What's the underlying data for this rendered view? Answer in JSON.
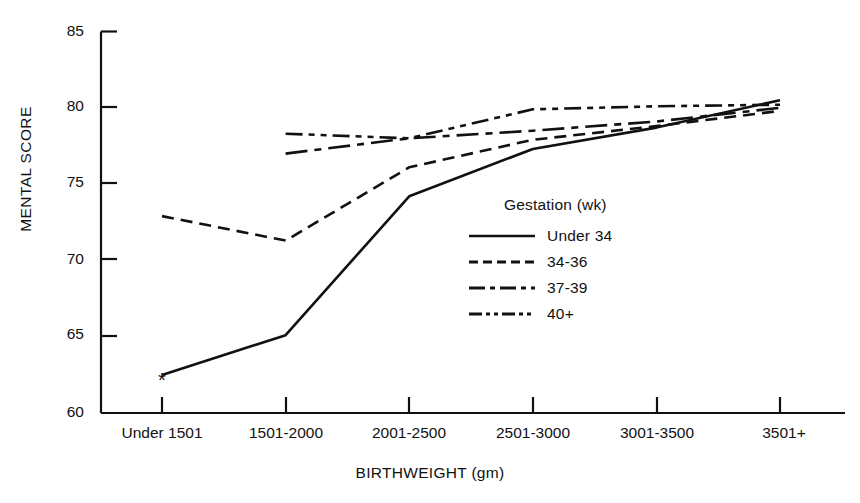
{
  "chart_data": {
    "type": "line",
    "title": "",
    "xlabel": "BIRTHWEIGHT (gm)",
    "ylabel": "MENTAL SCORE",
    "categories": [
      "Under 1501",
      "1501-2000",
      "2001-2500",
      "2501-3000",
      "3001-3500",
      "3501+"
    ],
    "ylim": [
      60,
      85
    ],
    "yticks": [
      60,
      65,
      70,
      75,
      80,
      85
    ],
    "ytick_labels": [
      "60",
      "65",
      "70",
      "75",
      "80",
      "85"
    ],
    "grid": false,
    "legend_position": "center",
    "legend_title": "Gestation (wk)",
    "annotations": [
      {
        "text": "*",
        "series": "Under 34",
        "category": "Under 1501",
        "value": 62.5,
        "note": "asterisk marker at first point of Under 34 series"
      }
    ],
    "series": [
      {
        "name": "Under 34",
        "style": "solid",
        "values": [
          62.5,
          65.1,
          74.2,
          77.3,
          78.7,
          80.5
        ]
      },
      {
        "name": "34-36",
        "style": "dashed",
        "values": [
          72.9,
          71.3,
          76.1,
          77.9,
          78.8,
          79.8
        ]
      },
      {
        "name": "37-39",
        "style": "dash-dot",
        "values": [
          null,
          77.0,
          78.0,
          78.5,
          79.1,
          80.0
        ]
      },
      {
        "name": "40+",
        "style": "dash-dot-dot",
        "values": [
          null,
          78.3,
          78.0,
          79.9,
          80.1,
          80.2
        ]
      }
    ]
  },
  "axes": {
    "y_axis_name": "MENTAL SCORE",
    "x_axis_name": "BIRTHWEIGHT (gm)"
  },
  "legend": {
    "title": "Gestation (wk)",
    "entries": [
      {
        "label": "Under 34",
        "style": "solid"
      },
      {
        "label": "34-36",
        "style": "dashed"
      },
      {
        "label": "37-39",
        "style": "dash-dot"
      },
      {
        "label": "40+",
        "style": "dash-dot-dot"
      }
    ]
  }
}
